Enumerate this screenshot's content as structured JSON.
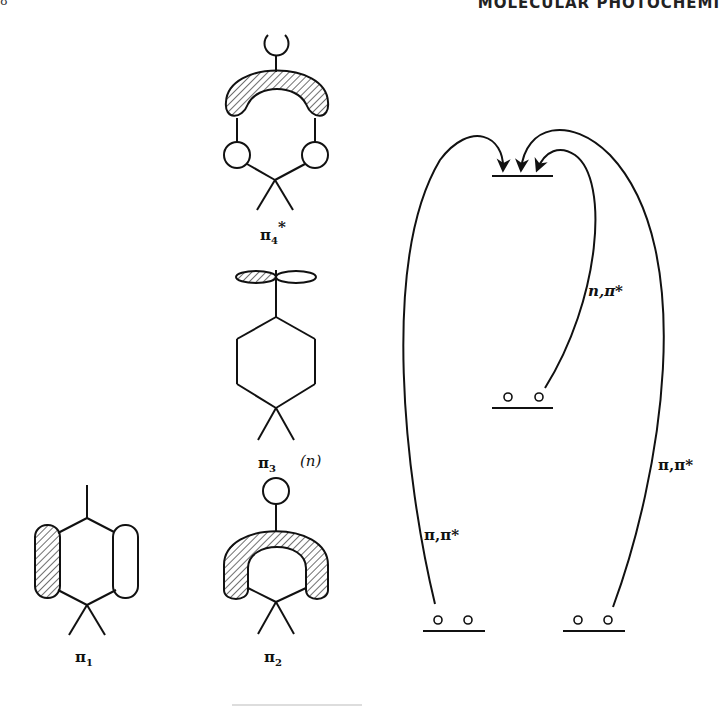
{
  "page": {
    "running_head": "MOLECULAR PHOTOCHEMI",
    "page_mark": "8"
  },
  "orbitals": [
    {
      "id": "pi4star",
      "label": "π",
      "subscript": "4",
      "superscript": "*",
      "note": ""
    },
    {
      "id": "pi3",
      "label": "π",
      "subscript": "3",
      "superscript": "",
      "note": "(n)"
    },
    {
      "id": "pi1",
      "label": "π",
      "subscript": "1",
      "superscript": "",
      "note": ""
    },
    {
      "id": "pi2",
      "label": "π",
      "subscript": "2",
      "superscript": "",
      "note": ""
    }
  ],
  "energy_diagram": {
    "levels": [
      {
        "id": "excited",
        "label": ""
      },
      {
        "id": "n-level",
        "label": "",
        "electrons": 2
      },
      {
        "id": "pi1-level",
        "label": "",
        "electrons": 2
      },
      {
        "id": "pi2-level",
        "label": "",
        "electrons": 2
      }
    ],
    "transitions": [
      {
        "id": "n-pi-star",
        "label": "n,π*"
      },
      {
        "id": "pi-pi-star-left",
        "label": "π,π*"
      },
      {
        "id": "pi-pi-star-right",
        "label": "π,π*"
      }
    ]
  }
}
